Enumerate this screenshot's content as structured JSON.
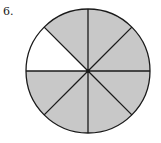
{
  "problem_number": "6.",
  "figure": {
    "type": "fraction-circle",
    "total_sections": 8,
    "shaded_sections": 7,
    "unshaded_sections": 1,
    "unshaded_position": "upper-left",
    "shaded_color": "#c8c8c8",
    "unshaded_color": "#ffffff",
    "stroke_color": "#1a1a1a"
  }
}
